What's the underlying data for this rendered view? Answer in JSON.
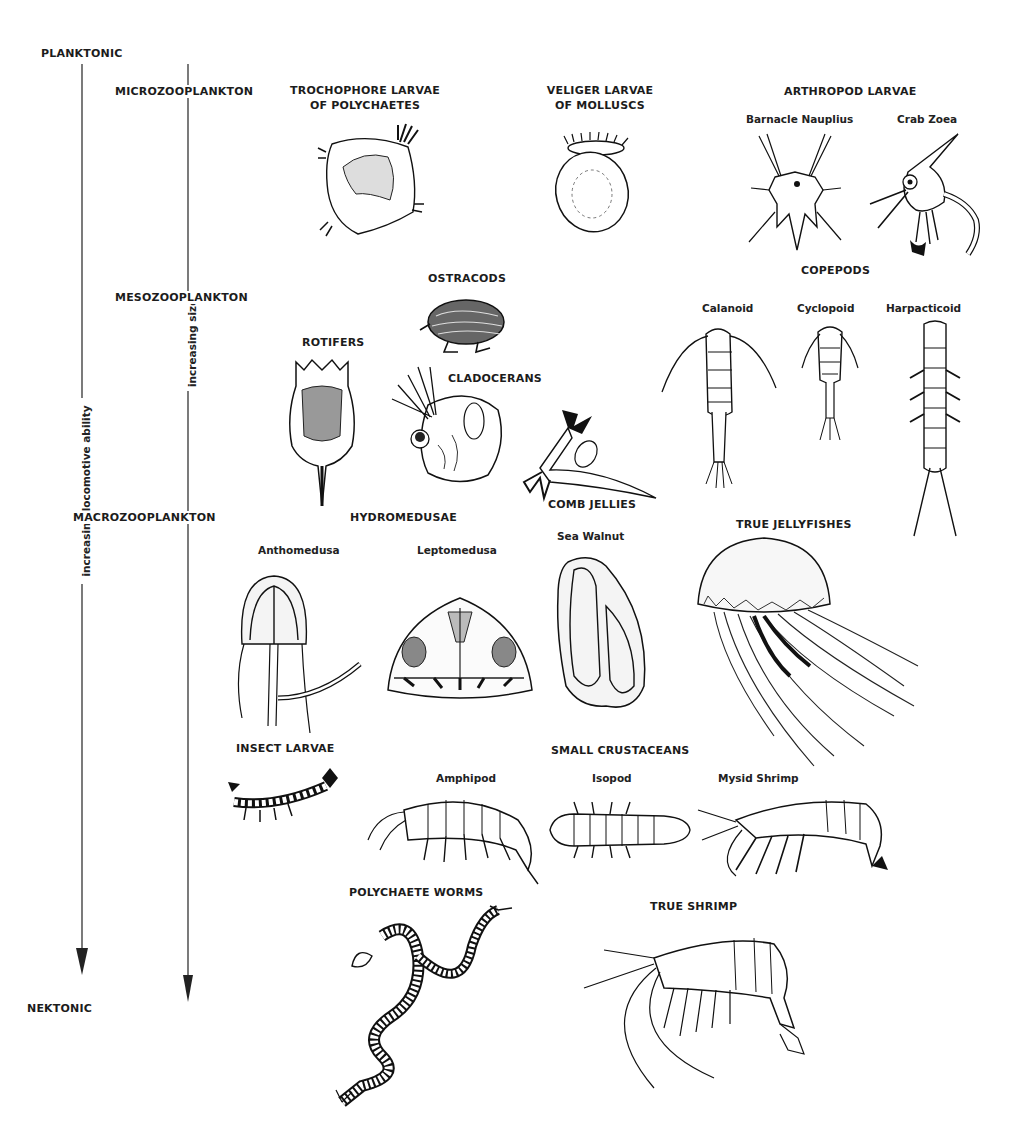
{
  "axes": {
    "top_label": "PLANKTONIC",
    "bottom_label": "NEKTONIC",
    "left_axis_label": "increasing locomotive ability",
    "right_axis_label": "increasing size"
  },
  "size_classes": [
    {
      "label": "MICROZOOPLANKTON"
    },
    {
      "label": "MESOZOOPLANKTON"
    },
    {
      "label": "MACROZOOPLANKTON"
    }
  ],
  "groups": {
    "trochophore": {
      "line1": "TROCHOPHORE LARVAE",
      "line2": "OF POLYCHAETES"
    },
    "veliger": {
      "line1": "VELIGER LARVAE",
      "line2": "OF MOLLUSCS"
    },
    "arthropod": {
      "title": "ARTHROPOD LARVAE",
      "items": [
        "Barnacle Nauplius",
        "Crab Zoea"
      ]
    },
    "ostracods": {
      "title": "OSTRACODS"
    },
    "copepods": {
      "title": "COPEPODS",
      "items": [
        "Calanoid",
        "Cyclopoid",
        "Harpacticoid"
      ]
    },
    "rotifers": {
      "title": "ROTIFERS"
    },
    "cladocerans": {
      "title": "CLADOCERANS"
    },
    "hydromedusae": {
      "title": "HYDROMEDUSAE",
      "items": [
        "Anthomedusa",
        "Leptomedusa"
      ]
    },
    "comb_jellies": {
      "title": "COMB JELLIES",
      "items": [
        "Sea Walnut"
      ]
    },
    "true_jellyfishes": {
      "title": "TRUE JELLYFISHES"
    },
    "insect_larvae": {
      "title": "INSECT LARVAE"
    },
    "small_crustaceans": {
      "title": "SMALL CRUSTACEANS",
      "items": [
        "Amphipod",
        "Isopod",
        "Mysid Shrimp"
      ]
    },
    "polychaete_worms": {
      "title": "POLYCHAETE WORMS"
    },
    "true_shrimp": {
      "title": "TRUE SHRIMP"
    }
  }
}
